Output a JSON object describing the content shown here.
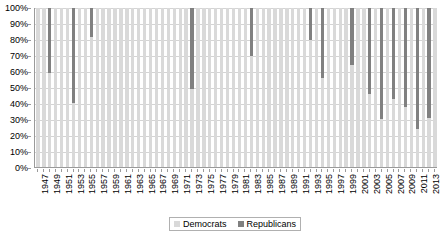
{
  "chart_data": {
    "type": "bar",
    "subtype": "100% stacked column",
    "title": "",
    "xlabel": "",
    "ylabel": "",
    "ylim": [
      0,
      100
    ],
    "yticks": [
      "0%",
      "10%",
      "20%",
      "30%",
      "40%",
      "50%",
      "60%",
      "70%",
      "80%",
      "90%",
      "100%"
    ],
    "ytick_values": [
      0,
      10,
      20,
      30,
      40,
      50,
      60,
      70,
      80,
      90,
      100
    ],
    "grid": true,
    "legend_position": "bottom-center",
    "x": [
      1947,
      1948,
      1949,
      1950,
      1951,
      1952,
      1953,
      1954,
      1955,
      1956,
      1957,
      1958,
      1959,
      1960,
      1961,
      1962,
      1963,
      1964,
      1965,
      1966,
      1967,
      1968,
      1969,
      1970,
      1971,
      1972,
      1973,
      1974,
      1975,
      1976,
      1977,
      1978,
      1979,
      1980,
      1981,
      1982,
      1983,
      1984,
      1985,
      1986,
      1987,
      1988,
      1989,
      1990,
      1991,
      1992,
      1993,
      1994,
      1995,
      1996,
      1997,
      1998,
      1999,
      2000,
      2001,
      2002,
      2003,
      2004,
      2005,
      2006,
      2007,
      2008,
      2009,
      2010,
      2011,
      2012,
      2013,
      2014
    ],
    "xtick_labels": [
      "1947",
      "1949",
      "1951",
      "1953",
      "1955",
      "1957",
      "1959",
      "1961",
      "1963",
      "1965",
      "1967",
      "1969",
      "1971",
      "1973",
      "1975",
      "1977",
      "1979",
      "1981",
      "1983",
      "1985",
      "1987",
      "1989",
      "1991",
      "1993",
      "1995",
      "1997",
      "1999",
      "2001",
      "2003",
      "2005",
      "2007",
      "2009",
      "2011",
      "2013"
    ],
    "xtick_step": 2,
    "series": [
      {
        "name": "Democrats",
        "color": "#d9d9d9",
        "values": [
          100,
          100,
          59,
          100,
          100,
          100,
          40,
          100,
          100,
          82,
          100,
          100,
          100,
          100,
          100,
          100,
          100,
          100,
          100,
          100,
          100,
          100,
          100,
          100,
          100,
          100,
          49,
          100,
          100,
          100,
          100,
          100,
          100,
          100,
          100,
          100,
          70,
          100,
          100,
          100,
          100,
          100,
          100,
          100,
          100,
          100,
          80,
          100,
          56,
          100,
          100,
          100,
          100,
          64,
          100,
          100,
          46,
          100,
          30,
          100,
          43,
          100,
          38,
          100,
          24,
          100,
          31,
          100
        ]
      },
      {
        "name": "Republicans",
        "color": "#808080",
        "values": [
          0,
          0,
          41,
          0,
          0,
          0,
          60,
          0,
          0,
          18,
          0,
          0,
          0,
          0,
          0,
          0,
          0,
          0,
          0,
          0,
          0,
          0,
          0,
          0,
          0,
          0,
          51,
          0,
          0,
          0,
          0,
          0,
          0,
          0,
          0,
          0,
          30,
          0,
          0,
          0,
          0,
          0,
          0,
          0,
          0,
          0,
          20,
          0,
          44,
          0,
          0,
          0,
          0,
          36,
          0,
          0,
          54,
          0,
          70,
          0,
          57,
          0,
          62,
          0,
          76,
          0,
          69,
          0
        ]
      }
    ]
  },
  "legend": {
    "entries": [
      {
        "label": "Democrats",
        "color": "#d9d9d9"
      },
      {
        "label": "Republicans",
        "color": "#808080"
      }
    ]
  }
}
